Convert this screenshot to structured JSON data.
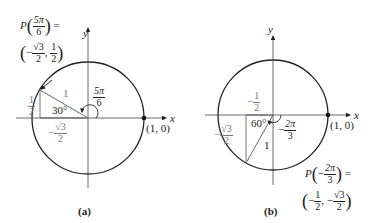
{
  "panels": [
    {
      "id": "a",
      "caption": "(a)",
      "axis_x_label": "x",
      "axis_y_label": "y",
      "point_label": "(1, 0)",
      "angle_label": {
        "num": "5π",
        "den": "6"
      },
      "reference_angle": "30°",
      "hypotenuse_label": "1",
      "vertical_leg": {
        "num": "1",
        "den": "2"
      },
      "horizontal_leg": {
        "sign": "−",
        "num": "√3",
        "den": "2"
      },
      "point_expr": {
        "prefix": "P",
        "arg": {
          "num": "5π",
          "den": "6"
        },
        "equals": "=",
        "coords": [
          {
            "sign": "−",
            "num": "√3",
            "den": "2"
          },
          {
            "sign": "",
            "num": "1",
            "den": "2"
          }
        ]
      }
    },
    {
      "id": "b",
      "caption": "(b)",
      "axis_x_label": "x",
      "axis_y_label": "y",
      "point_label": "(1, 0)",
      "angle_label": {
        "sign": "−",
        "num": "2π",
        "den": "3"
      },
      "reference_angle": "60°",
      "hypotenuse_label": "1",
      "vertical_leg": {
        "sign": "−",
        "num": "1",
        "den": "2"
      },
      "horizontal_leg": {
        "sign": "−",
        "num": "√3",
        "den": "2"
      },
      "point_expr": {
        "prefix": "P",
        "arg": {
          "sign": "−",
          "num": "2π",
          "den": "3"
        },
        "equals": "=",
        "coords": [
          {
            "sign": "−",
            "num": "1",
            "den": "2"
          },
          {
            "sign": "−",
            "num": "√3",
            "den": "2"
          }
        ]
      }
    }
  ]
}
